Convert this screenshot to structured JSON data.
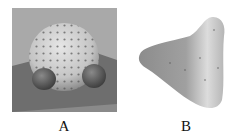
{
  "figure": {
    "panels": [
      {
        "id": "A",
        "label": "A",
        "description": "3D rendered dome-shaped object covered in dots with two dark spheres at base on a gray plane",
        "background": "#a9a9a9"
      },
      {
        "id": "B",
        "label": "B",
        "description": "Smooth gray 3D triangular/conical shape with sparse dots on white background",
        "background": "#ffffff"
      }
    ]
  }
}
